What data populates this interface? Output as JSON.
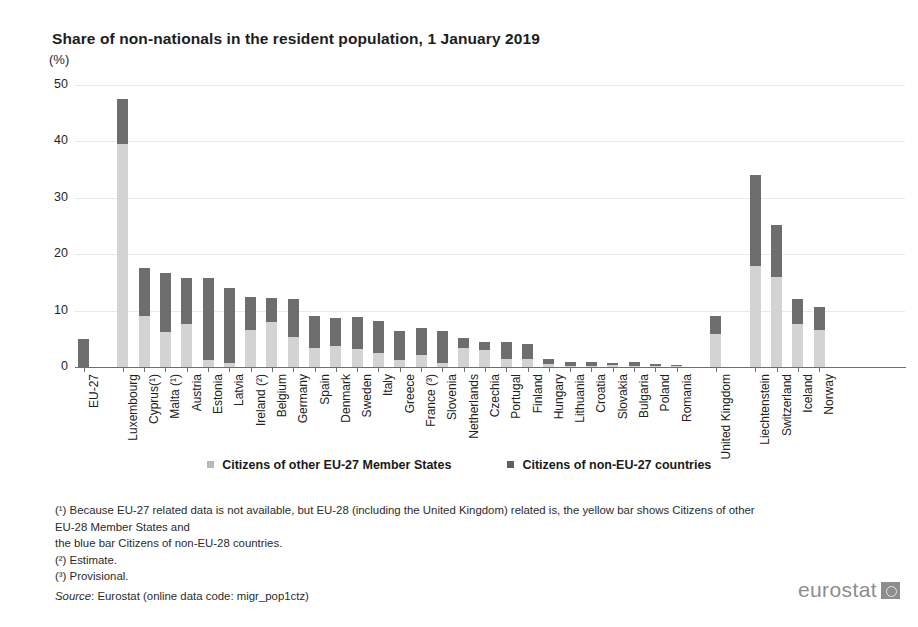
{
  "title": "Share of non-nationals in the resident population, 1 January 2019",
  "unit": "(%)",
  "legend": {
    "eu": "Citizens of other EU-27 Member States",
    "non_eu": "Citizens of non-EU-27 countries"
  },
  "notes": {
    "n1": "(¹) Because EU-27 related data is not available, but EU-28 (including  the United Kingdom) related is, the yellow bar shows Citizens of other EU-28 Member States and",
    "n1b": "the blue bar Citizens of non-EU-28 countries.",
    "n2": "(²) Estimate.",
    "n3": "(³) Provisional.",
    "source_word": "Source",
    "source_rest": ": Eurostat (online data code: migr_pop1ctz)"
  },
  "logo": {
    "text": "eurostat",
    "mark": "eu-emblem-icon"
  },
  "colors": {
    "eu_segment": "#d3d3d3",
    "non_eu_segment": "#6e6e6e",
    "axis": "#6e6e6e",
    "grid": "#e9e9e9"
  },
  "chart_data": {
    "type": "bar",
    "subtype": "stacked",
    "title": "Share of non-nationals in the resident population, 1 January 2019",
    "xlabel": "",
    "ylabel": "(%)",
    "ylim": [
      0,
      50
    ],
    "yticks": [
      0,
      10,
      20,
      30,
      40,
      50
    ],
    "grid": true,
    "legend_position": "bottom",
    "categories": [
      "EU-27",
      "Luxembourg",
      "Cyprus(¹)",
      "Malta (¹)",
      "Austria",
      "Estonia",
      "Latvia",
      "Ireland (²)",
      "Belgium",
      "Germany",
      "Spain",
      "Denmark",
      "Sweden",
      "Italy",
      "Greece",
      "France (³)",
      "Slovenia",
      "Netherlands",
      "Czechia",
      "Portugal",
      "Finland",
      "Hungary",
      "Lithuania",
      "Croatia",
      "Slovakia",
      "Bulgaria",
      "Poland",
      "Romania",
      "United Kingdom",
      "Liechtenstein",
      "Switzerland",
      "Iceland",
      "Norway"
    ],
    "group_breaks_after": [
      "EU-27",
      "Romania",
      "United Kingdom"
    ],
    "series": [
      {
        "name": "Citizens of other EU-27 Member States",
        "color": "#d3d3d3",
        "values": [
          0.0,
          39.6,
          9.1,
          6.2,
          7.6,
          1.2,
          0.8,
          6.5,
          7.9,
          5.3,
          3.4,
          3.8,
          3.2,
          2.5,
          1.3,
          2.2,
          0.8,
          3.3,
          3.1,
          1.4,
          1.4,
          0.5,
          0.2,
          0.2,
          0.3,
          0.1,
          0.1,
          0.1,
          5.8,
          17.9,
          15.9,
          7.7,
          6.5
        ]
      },
      {
        "name": "Citizens of non-EU-27 countries",
        "color": "#6e6e6e",
        "values": [
          4.9,
          7.9,
          8.4,
          10.5,
          8.1,
          14.6,
          13.2,
          6.0,
          4.3,
          6.8,
          5.6,
          4.9,
          5.6,
          5.7,
          5.0,
          4.7,
          5.6,
          1.8,
          1.3,
          3.0,
          2.6,
          1.0,
          0.7,
          0.6,
          0.5,
          0.7,
          0.3,
          0.1,
          3.3,
          16.1,
          9.2,
          4.4,
          4.2
        ]
      }
    ],
    "totals": [
      4.9,
      47.5,
      17.5,
      16.7,
      15.7,
      15.8,
      14.0,
      12.5,
      12.2,
      12.1,
      9.0,
      8.7,
      8.8,
      8.2,
      6.3,
      6.9,
      6.4,
      5.1,
      4.4,
      4.4,
      4.0,
      1.5,
      0.9,
      0.8,
      0.8,
      0.8,
      0.4,
      0.2,
      9.1,
      34.0,
      25.1,
      12.1,
      10.7
    ]
  }
}
